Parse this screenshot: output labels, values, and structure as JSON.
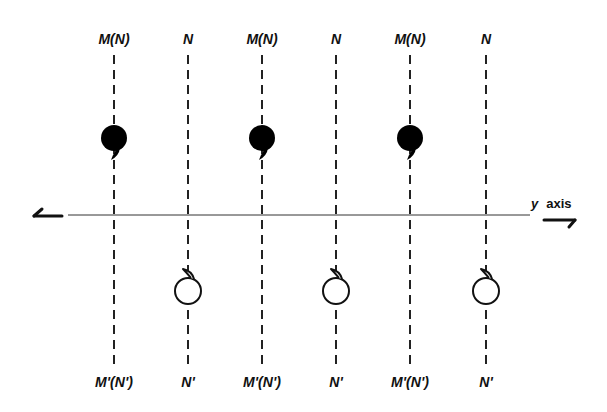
{
  "diagram": {
    "axis": {
      "label_var": "y",
      "label_word": "axis",
      "direction": "horizontal"
    },
    "columns": [
      {
        "x": 114,
        "top_label": "M(N)",
        "bottom_label": "M'(N')",
        "symbol": "filled-comma",
        "symbol_position": "above-axis"
      },
      {
        "x": 188,
        "top_label": "N",
        "bottom_label": "N'",
        "symbol": "open-hook",
        "symbol_position": "below-axis"
      },
      {
        "x": 262,
        "top_label": "M(N)",
        "bottom_label": "M'(N')",
        "symbol": "filled-comma",
        "symbol_position": "above-axis"
      },
      {
        "x": 336,
        "top_label": "N",
        "bottom_label": "N'",
        "symbol": "open-hook",
        "symbol_position": "below-axis"
      },
      {
        "x": 410,
        "top_label": "M(N)",
        "bottom_label": "M'(N')",
        "symbol": "filled-comma",
        "symbol_position": "above-axis"
      },
      {
        "x": 486,
        "top_label": "N",
        "bottom_label": "N'",
        "symbol": "open-hook",
        "symbol_position": "below-axis"
      }
    ],
    "colors": {
      "ink": "#111111",
      "background": "#ffffff"
    }
  }
}
